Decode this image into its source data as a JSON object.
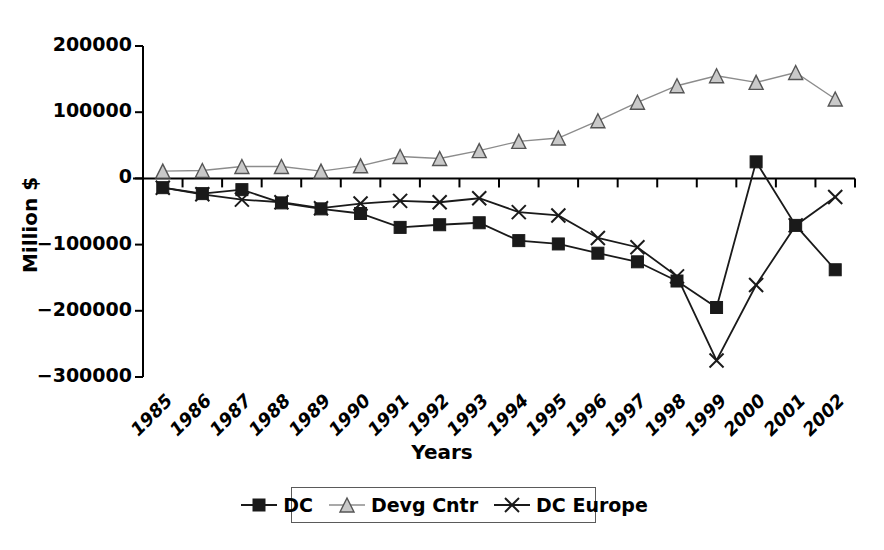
{
  "chart_data": {
    "type": "line",
    "title": "",
    "xlabel": "Years",
    "ylabel": "Million $",
    "categories": [
      "1985",
      "1986",
      "1987",
      "1988",
      "1989",
      "1990",
      "1991",
      "1992",
      "1993",
      "1994",
      "1995",
      "1996",
      "1997",
      "1998",
      "1999",
      "2000",
      "2001",
      "2002"
    ],
    "ylim": [
      -300000,
      200000
    ],
    "ytick_labels": [
      "200000",
      "100000",
      "0",
      "-100000",
      "-200000",
      "-300000"
    ],
    "ytick_values": [
      200000,
      100000,
      0,
      -100000,
      -200000,
      -300000
    ],
    "grid": false,
    "legend_position": "bottom",
    "series": [
      {
        "name": "DC",
        "marker": "filled-square",
        "color": "#1a1a1a",
        "values": [
          -14000,
          -23000,
          -17000,
          -37000,
          -46000,
          -53000,
          -74000,
          -70000,
          -67000,
          -94000,
          -99000,
          -113000,
          -126000,
          -155000,
          -195000,
          25000,
          -71000,
          -138000
        ]
      },
      {
        "name": "Devg Cntr",
        "marker": "open-triangle",
        "color": "#8c8c8c",
        "values": [
          11000,
          12000,
          18000,
          18000,
          11000,
          19000,
          33000,
          30000,
          42000,
          56000,
          61000,
          87000,
          115000,
          140000,
          155000,
          145000,
          160000,
          120000
        ]
      },
      {
        "name": "DC Europe",
        "marker": "cross-x",
        "color": "#1a1a1a",
        "values": [
          -14000,
          -24000,
          -32000,
          -36000,
          -45000,
          -38000,
          -34000,
          -36000,
          -30000,
          -51000,
          -56000,
          -90000,
          -104000,
          -148000,
          -275000,
          -161000,
          -71000,
          -28000
        ]
      }
    ]
  },
  "legend": {
    "items": [
      {
        "label": "DC",
        "marker": "filled-square-marker"
      },
      {
        "label": "Devg Cntr",
        "marker": "open-triangle-marker"
      },
      {
        "label": "DC Europe",
        "marker": "cross-x-marker"
      }
    ]
  }
}
